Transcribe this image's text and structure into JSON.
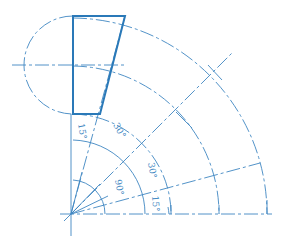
{
  "diagram": {
    "type": "elbow-pipe-segment-layout",
    "color": "#3f87c2",
    "outline_color": "#2a79b8",
    "angles": [
      {
        "label": "15°",
        "position": "top-segment"
      },
      {
        "label": "30°",
        "position": "upper-middle"
      },
      {
        "label": "30°",
        "position": "lower-middle"
      },
      {
        "label": "15°",
        "position": "bottom-segment"
      },
      {
        "label": "90°",
        "position": "total"
      }
    ]
  }
}
